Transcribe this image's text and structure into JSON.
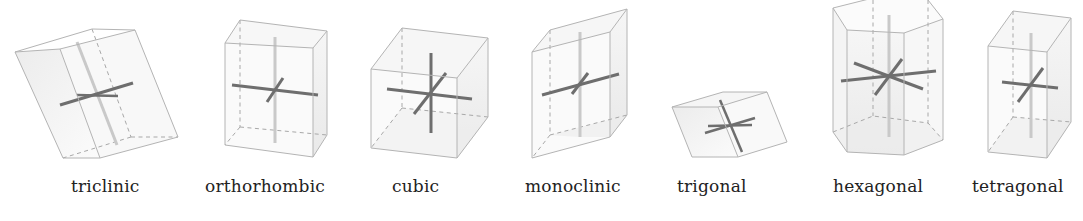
{
  "colors": {
    "edge": "#b4b4b4",
    "axis_dark": "#6e6e6e",
    "axis_light": "#c9c9c9",
    "face_fill": "#f2f2f2",
    "label_text": "#222222"
  },
  "systems": [
    {
      "id": "triclinic",
      "label": "triclinic"
    },
    {
      "id": "orthorhombic",
      "label": "orthorhombic"
    },
    {
      "id": "cubic",
      "label": "cubic"
    },
    {
      "id": "monoclinic",
      "label": "monoclinic"
    },
    {
      "id": "trigonal",
      "label": "trigonal"
    },
    {
      "id": "hexagonal",
      "label": "hexagonal"
    },
    {
      "id": "tetragonal",
      "label": "tetragonal"
    }
  ]
}
